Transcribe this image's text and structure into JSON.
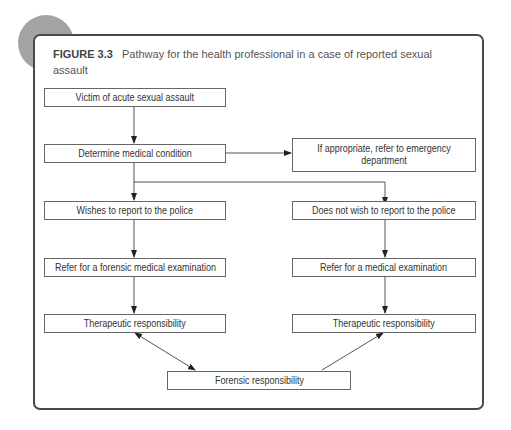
{
  "figure": {
    "label": "FIGURE 3.3",
    "title": "Pathway for the health professional in a case of reported sexual assault"
  },
  "nodes": {
    "victim": "Victim of acute sexual assault",
    "determine": "Determine medical condition",
    "emergency": "If appropriate, refer to emergency department",
    "wishes": "Wishes to report to the police",
    "not_wish": "Does not wish to report to the police",
    "forensic_exam": "Refer for a forensic medical examination",
    "medical_exam": "Refer for a medical examination",
    "therapeutic_left": "Therapeutic responsibility",
    "therapeutic_right": "Therapeutic responsibility",
    "forensic_resp": "Forensic responsibility"
  },
  "colors": {
    "frame": "#4a4a4a",
    "decoration": "#a3a3a3",
    "line": "#555555"
  }
}
